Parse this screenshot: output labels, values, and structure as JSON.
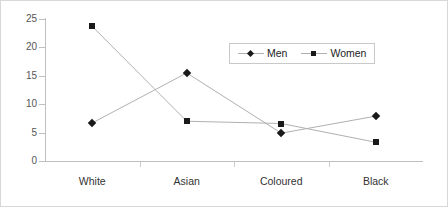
{
  "chart_data": {
    "type": "line",
    "title": "",
    "subtitle": "",
    "xlabel": "",
    "ylabel": "",
    "categories": [
      "White",
      "Asian",
      "Coloured",
      "Black"
    ],
    "series": [
      {
        "name": "Men",
        "marker": "diamond",
        "values": [
          6.7,
          15.5,
          4.9,
          7.9
        ]
      },
      {
        "name": "Women",
        "marker": "square",
        "values": [
          23.7,
          7.0,
          6.6,
          3.3
        ]
      }
    ],
    "ylim": [
      0,
      25
    ],
    "yticks": [
      0,
      5,
      10,
      15,
      20,
      25
    ],
    "ytick_labels": [
      "0",
      "5",
      "10",
      "15",
      "20",
      "25"
    ],
    "grid": false,
    "legend_position": "upper-right-inside",
    "line_color": "#b0b0b0",
    "marker_color": "#1a1a1a",
    "axis_color": "#bfbfbf",
    "border_color": "#d8d8d8"
  },
  "legend": {
    "entries": [
      {
        "label": "Men",
        "marker": "diamond"
      },
      {
        "label": "Women",
        "marker": "square"
      }
    ]
  }
}
